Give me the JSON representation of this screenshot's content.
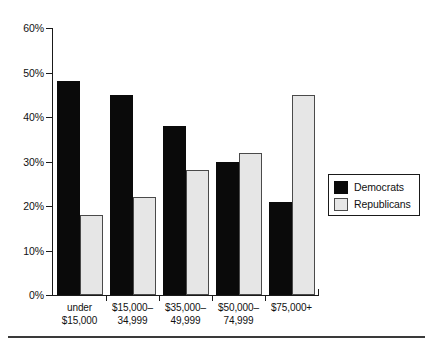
{
  "chart_data": {
    "type": "bar",
    "title": "",
    "subtitle": "",
    "xlabel": "",
    "ylabel": "",
    "categories": [
      "under $15,000",
      "$15,000–34,999",
      "$35,000–49,999",
      "$50,000–74,999",
      "$75,000+"
    ],
    "category_lines": [
      [
        "under",
        "$15,000"
      ],
      [
        "$15,000–",
        "34,999"
      ],
      [
        "$35,000–",
        "49,999"
      ],
      [
        "$50,000–",
        "74,999"
      ],
      [
        "$75,000+",
        ""
      ]
    ],
    "series": [
      {
        "name": "Democrats",
        "color": "#0a0a0a",
        "values": [
          48,
          45,
          38,
          30,
          21
        ]
      },
      {
        "name": "Republicans",
        "color": "#e6e6e6",
        "values": [
          18,
          22,
          28,
          32,
          45
        ]
      }
    ],
    "ylim": [
      0,
      60
    ],
    "ytick_values": [
      60,
      50,
      40,
      30,
      20,
      10,
      0
    ],
    "ytick_labels": [
      "60%",
      "50%",
      "40%",
      "30%",
      "20%",
      "10%",
      "0%"
    ],
    "grid": false,
    "legend_position": "right",
    "value_unit": "%"
  },
  "legend": {
    "entries": [
      {
        "label": "Democrats",
        "swatch": "black-square"
      },
      {
        "label": "Republicans",
        "swatch": "light-gray-square"
      }
    ]
  },
  "colors": {
    "democrat": "#0a0a0a",
    "republican": "#e6e6e6",
    "republican_border": "#4a4a4a",
    "axis": "#1a1a1a",
    "text": "#111111",
    "background": "#ffffff",
    "rule": "#3a3a3a"
  }
}
